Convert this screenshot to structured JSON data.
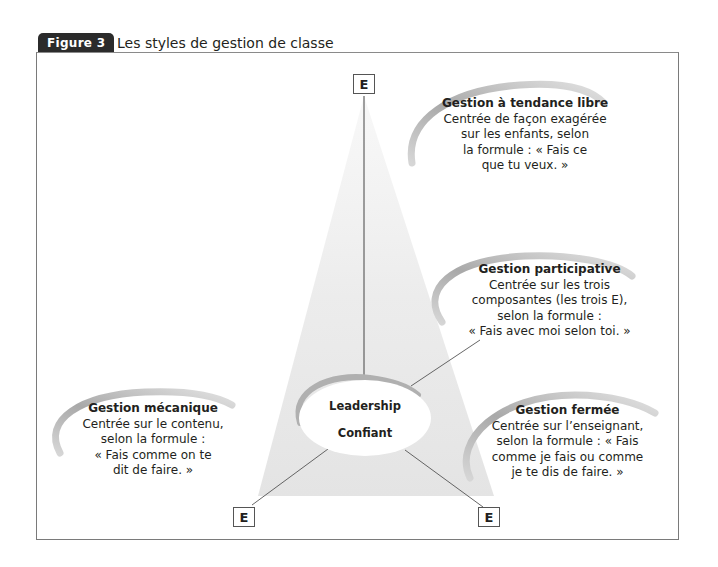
{
  "figure": {
    "label": "Figure 3",
    "title": "Les styles de gestion de classe"
  },
  "nodes": {
    "top_e": "E",
    "bottom_left_e": "E",
    "bottom_right_e": "E",
    "center": {
      "line1": "Leadership",
      "line2": "Confiant"
    }
  },
  "styles": [
    {
      "id": "libre",
      "title": "Gestion à tendance libre",
      "lines": [
        "Centrée de façon exagérée",
        "sur les enfants, selon",
        "la formule : « Fais ce",
        "que tu veux. »"
      ]
    },
    {
      "id": "participative",
      "title": "Gestion participative",
      "lines": [
        "Centrée sur les trois",
        "composantes (les trois E),",
        "selon la formule :",
        "« Fais avec moi selon toi. »"
      ]
    },
    {
      "id": "mecanique",
      "title": "Gestion mécanique",
      "lines": [
        "Centrée sur le contenu,",
        "selon la formule :",
        "« Fais comme on te",
        "dit de faire. »"
      ]
    },
    {
      "id": "fermee",
      "title": "Gestion fermée",
      "lines": [
        "Centrée sur l’enseignant,",
        "selon la formule : « Fais",
        "comme je fais ou comme",
        "je te dis de faire. »"
      ]
    }
  ],
  "colors": {
    "frame": "#7a7a7a",
    "label_bg": "#2b2b2b",
    "arc": "#b5b5b5",
    "cone": "#e8e8e8"
  }
}
